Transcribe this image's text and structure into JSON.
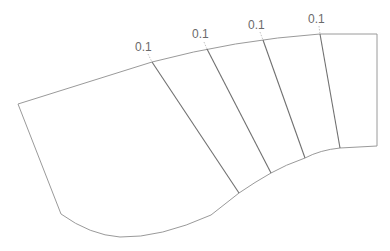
{
  "diagram": {
    "type": "curved-region-partition",
    "outline_color": "#9a9a9a",
    "divider_color": "#707070",
    "label_color": "#6a6a6a",
    "dividers": [
      {
        "label": "0.1",
        "top": [
          152,
          62
        ],
        "bottom": [
          239,
          193
        ],
        "label_pos": [
          135,
          50
        ]
      },
      {
        "label": "0.1",
        "top": [
          207,
          49
        ],
        "bottom": [
          271,
          173
        ],
        "label_pos": [
          192,
          38
        ]
      },
      {
        "label": "0.1",
        "top": [
          263,
          40
        ],
        "bottom": [
          305,
          158
        ],
        "label_pos": [
          248,
          28
        ]
      },
      {
        "label": "0.1",
        "top": [
          320,
          34
        ],
        "bottom": [
          340,
          148
        ],
        "label_pos": [
          308,
          22
        ]
      }
    ]
  }
}
